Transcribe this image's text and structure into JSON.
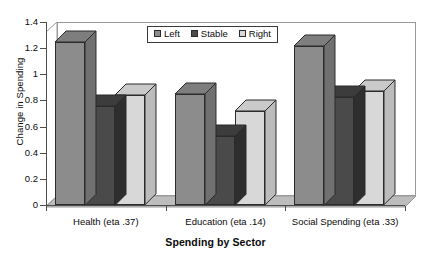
{
  "chart_data": {
    "type": "bar",
    "title": "",
    "xlabel": "Spending by Sector",
    "ylabel": "Change in Spending",
    "categories": [
      "Health (eta .37)",
      "Education (eta .14)",
      "Social Spending (eta .33)"
    ],
    "series": [
      {
        "name": "Left",
        "values": [
          1.25,
          0.85,
          1.22
        ],
        "color": "#8c8c8c"
      },
      {
        "name": "Stable",
        "values": [
          0.76,
          0.53,
          0.83
        ],
        "color": "#4a4a4a"
      },
      {
        "name": "Right",
        "values": [
          0.84,
          0.72,
          0.87
        ],
        "color": "#d8d8d8"
      }
    ],
    "ylim": [
      0,
      1.4
    ],
    "ytick_step": 0.2,
    "ytick_labels": [
      "0",
      "0.2",
      "0.4",
      "0.6",
      "0.8",
      "1",
      "1.2",
      "1.4"
    ],
    "ytick_values": [
      0,
      0.2,
      0.4,
      0.6,
      0.8,
      1,
      1.2,
      1.4
    ],
    "grid": false,
    "legend_position": "top-center",
    "style": "3d-grouped-bar",
    "background": "#ffffff",
    "axis_color": "#4d4d4d",
    "frame_color": "#9a9a9a",
    "bar_outline": "#2b2b2b"
  },
  "legend": {
    "entries": [
      {
        "label": "Left"
      },
      {
        "label": "Stable"
      },
      {
        "label": "Right"
      }
    ]
  }
}
